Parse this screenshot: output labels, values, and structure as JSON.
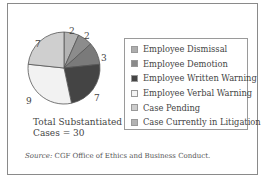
{
  "chart_data": {
    "type": "pie",
    "title": "",
    "total_label_line1": "Total Substantiated",
    "total_label_line2": "Cases = 30",
    "slices": [
      {
        "label": "Employee Dismissal",
        "value": 2,
        "color": "#b4b4b4"
      },
      {
        "label": "Employee Demotion",
        "value": 2,
        "color": "#8c8c8c"
      },
      {
        "label": "Case Currently in Litigation",
        "value": 3,
        "color": "#7a7a7a"
      },
      {
        "label": "Employee Written Warning",
        "value": 7,
        "color": "#444444"
      },
      {
        "label": "Employee Verbal Warning",
        "value": 9,
        "color": "#f2f2f2"
      },
      {
        "label": "Case Pending",
        "value": 7,
        "color": "#cfcfcf"
      }
    ],
    "legend": [
      {
        "label": "Employee Dismissal",
        "color": "#adadad"
      },
      {
        "label": "Employee Demotion",
        "color": "#8a8a8a"
      },
      {
        "label": "Employee Written Warning",
        "color": "#444444"
      },
      {
        "label": "Employee Verbal Warning",
        "color": "#f4f4f4"
      },
      {
        "label": "Case Pending",
        "color": "#cccccc"
      },
      {
        "label": "Case Currently in Litigation",
        "color": "#b2b2b2"
      }
    ],
    "legend_position": "right"
  },
  "source_label": "Source:",
  "source_text": " CGF Office of Ethics and Business Conduct."
}
